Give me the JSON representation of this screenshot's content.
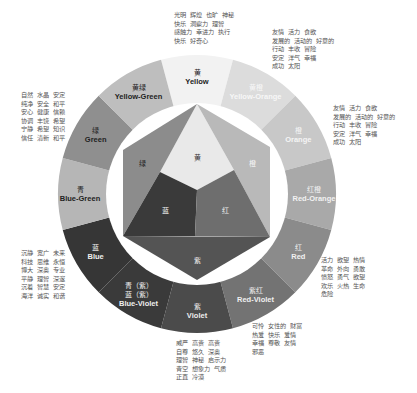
{
  "diagram": {
    "type": "color-wheel",
    "center": [
      197,
      194
    ],
    "outer_radius": 139,
    "inner_radius": 91,
    "segments": [
      {
        "key": "yellow",
        "cn": "黄",
        "en": "Yellow",
        "color": "#f2f2f2",
        "text_color": "#222222"
      },
      {
        "key": "yellow-orange",
        "cn": "黄橙",
        "en": "Yellow-Orange",
        "color": "#dcdcdc",
        "text_color": "#f7f7f7"
      },
      {
        "key": "orange",
        "cn": "橙",
        "en": "Orange",
        "color": "#c8c8c8",
        "text_color": "#f5f5f5"
      },
      {
        "key": "red-orange",
        "cn": "红橙",
        "en": "Red-Orange",
        "color": "#a9a9a9",
        "text_color": "#f2f2f2"
      },
      {
        "key": "red",
        "cn": "红",
        "en": "Red",
        "color": "#8b8b8b",
        "text_color": "#f2f2f2"
      },
      {
        "key": "red-violet",
        "cn": "紫红",
        "en": "Red-Violet",
        "color": "#737373",
        "text_color": "#f0f0f0"
      },
      {
        "key": "violet",
        "cn": "紫",
        "en": "Violet",
        "color": "#4b4b4b",
        "text_color": "#eeeeee"
      },
      {
        "key": "blue-violet",
        "cn": "青（紫）\n蓝（紫）",
        "en": "Blue-Violet",
        "color": "#3a3a3a",
        "text_color": "#eeeeee"
      },
      {
        "key": "blue",
        "cn": "蓝",
        "en": "Blue",
        "color": "#363636",
        "text_color": "#eeeeee"
      },
      {
        "key": "blue-green",
        "cn": "青",
        "en": "Blue-Green",
        "color": "#b6b6b6",
        "text_color": "#222222"
      },
      {
        "key": "green",
        "cn": "绿",
        "en": "Green",
        "color": "#8f8f8f",
        "text_color": "#222222"
      },
      {
        "key": "yellow-green",
        "cn": "黄绿",
        "en": "Yellow-Green",
        "color": "#bebebe",
        "text_color": "#222222"
      }
    ],
    "hexagon": [
      {
        "key": "hex-yellow",
        "label": "黄",
        "color": "#e9e9e9",
        "text_color": "#333333"
      },
      {
        "key": "hex-orange",
        "label": "橙",
        "color": "#b9b9b9",
        "text_color": "#f5f5f5"
      },
      {
        "key": "hex-green",
        "label": "绿",
        "color": "#8c8c8c",
        "text_color": "#222222"
      },
      {
        "key": "hex-blue",
        "label": "蓝",
        "color": "#3a3a3a",
        "text_color": "#eeeeee"
      },
      {
        "key": "hex-red",
        "label": "红",
        "color": "#6e6e6e",
        "text_color": "#eeeeee"
      },
      {
        "key": "hex-violet",
        "label": "紫",
        "color": "#545454",
        "text_color": "#eeeeee"
      }
    ],
    "notes": {
      "yellow": "光明  辉煌  也旷  神秘\n快乐  洞察力  理智\n感触力  幸进力  执行\n快乐  好奇心",
      "yellow_orange": "友情  活力  食欲\n发展的  活动的  好意的\n行动  丰收  冒险\n安定  洋气  幸福\n成功  太阳",
      "orange": "友情  活力  食欲\n发展的  活动的  好意的\n行动  丰收  冒险\n安定  洋气  幸福\n成功  太阳",
      "red": "活力  欲望  热情\n革命  外向  勇敢\n愤怒  勇气  欲望\n欢乐  火热  生命\n危险",
      "red_violet": "可怜  女性的  财富\n热爱  快乐  爱情\n幸福  尊敬  友情\n邪恶",
      "violet": "威严  高贵  高贵\n自尊  悠久  深奥\n理智  神秘  启示力\n青空  想象力  气质\n正直  冷漠",
      "green": "自然  水晶  安定\n纯净  安全  和平\n安心  健康  信赖\n协调  丰饶  希望\n宁静  希望  知识\n信任  清新  和平",
      "blue": "沉静  宽广  未来\n科技  思维  永恒\n博大  深奥  专业\n平静  理智  深邃\n沉着  智慧  安定\n海洋  诚实  和谐"
    }
  }
}
